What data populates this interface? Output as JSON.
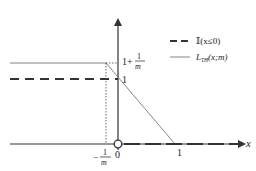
{
  "figure": {
    "axes": {
      "x_label": "x",
      "origin_label": "0",
      "x_tick_one": "1",
      "x_tick_neg_num": "1",
      "x_tick_neg_den": "m",
      "x_tick_neg_sign": "−"
    },
    "y_labels": {
      "one": "1",
      "top_prefix": "1+",
      "top_num": "1",
      "top_den": "m"
    },
    "legend": {
      "items": [
        {
          "label": "𝕀(x≤0)",
          "style": "dashed"
        },
        {
          "label_main": "L",
          "label_sub": "TH",
          "label_rest": "(x;m)",
          "style": "solid-thin"
        }
      ]
    },
    "colors": {
      "axis": "#333333",
      "hinge": "#777777",
      "indicator": "#333333",
      "dotted": "#444444"
    }
  }
}
